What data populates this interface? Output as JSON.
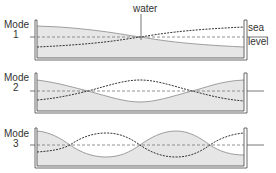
{
  "labels": {
    "water": "water",
    "sea": "sea",
    "level": "level"
  },
  "modes": [
    {
      "title": "Mode",
      "number": "1",
      "top": 20,
      "sea_y": 37
    },
    {
      "title": "Mode",
      "number": "2",
      "top": 73,
      "sea_y": 91
    },
    {
      "title": "Mode",
      "number": "3",
      "top": 128,
      "sea_y": 145
    }
  ],
  "colors": {
    "water_fill": "#e6e6e6",
    "tank_stroke": "#444444",
    "dashed_line": "#333333",
    "sea_level_line": "#555555"
  }
}
